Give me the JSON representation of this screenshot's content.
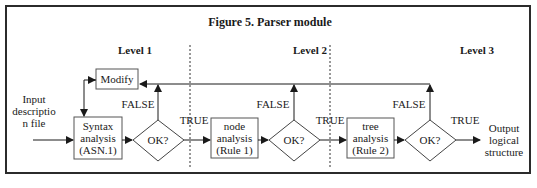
{
  "figure": {
    "title": "Figure 5.   Parser module",
    "levels": [
      "Level 1",
      "Level 2",
      "Level 3"
    ],
    "input_label": [
      "Input",
      "descriptio",
      "n file"
    ],
    "output_label": [
      "Output",
      "logical",
      "structure"
    ],
    "modify_label": "Modify",
    "boxes": [
      {
        "lines": [
          "Syntax",
          "analysis",
          "(ASN.1)"
        ]
      },
      {
        "lines": [
          "node",
          "analysis",
          "(Rule 1)"
        ]
      },
      {
        "lines": [
          "tree",
          "analysis",
          "(Rule 2)"
        ]
      }
    ],
    "decision_label": "OK?",
    "false_label": "FALSE",
    "true_label": "TRUE",
    "colors": {
      "line": "#1a1a1a",
      "box_border": "#555555",
      "background": "#ffffff"
    }
  }
}
